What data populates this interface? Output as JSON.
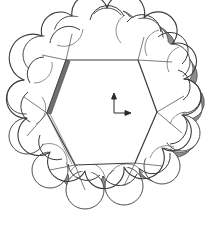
{
  "figure": {
    "title": "Hexagonal prism with twelve circular lobes",
    "type": "technical-line-drawing",
    "background_color": "#ffffff",
    "line_color": "#3a3a3a",
    "shade_color": "#6f6f6f",
    "dark_edge_color": "#4a4a4a",
    "fill_color": "#ffffff",
    "canvas": {
      "width": 214,
      "height": 226
    }
  },
  "geometry": {
    "hexagon": {
      "label": "central-hexagon-face",
      "vertices": [
        {
          "name": "top-left",
          "x": 66,
          "y": 60
        },
        {
          "name": "top-right",
          "x": 138,
          "y": 60
        },
        {
          "name": "right",
          "x": 157,
          "y": 112
        },
        {
          "name": "bottom-right",
          "x": 135,
          "y": 163
        },
        {
          "name": "bottom-left",
          "x": 75,
          "y": 165
        },
        {
          "name": "left",
          "x": 47,
          "y": 113
        }
      ]
    },
    "lobes": {
      "label": "perimeter-circular-lobes",
      "count": 12,
      "items": [
        {
          "index": 1,
          "cx": 107,
          "cy": 26,
          "r": 18,
          "shaded": true
        },
        {
          "index": 2,
          "cx": 144,
          "cy": 37,
          "r": 19,
          "shaded": true
        },
        {
          "index": 3,
          "cx": 172,
          "cy": 62,
          "r": 18,
          "shaded": true
        },
        {
          "index": 4,
          "cx": 184,
          "cy": 96,
          "r": 17,
          "shaded": true
        },
        {
          "index": 5,
          "cx": 182,
          "cy": 133,
          "r": 18,
          "shaded": true
        },
        {
          "index": 6,
          "cx": 162,
          "cy": 166,
          "r": 18,
          "shaded": true
        },
        {
          "index": 7,
          "cx": 124,
          "cy": 186,
          "r": 19,
          "shaded": true
        },
        {
          "index": 8,
          "cx": 85,
          "cy": 190,
          "r": 19,
          "shaded": true
        },
        {
          "index": 9,
          "cx": 50,
          "cy": 170,
          "r": 18,
          "shaded": false
        },
        {
          "index": 10,
          "cx": 27,
          "cy": 136,
          "r": 18,
          "shaded": false
        },
        {
          "index": 11,
          "cx": 24,
          "cy": 97,
          "r": 17,
          "shaded": false
        },
        {
          "index": 12,
          "cx": 42,
          "cy": 55,
          "r": 19,
          "shaded": false
        },
        {
          "index": 13,
          "cx": 72,
          "cy": 34,
          "r": 18,
          "shaded": false
        }
      ]
    },
    "highlight_edge": {
      "label": "upper-left-shaded-band",
      "from": {
        "x": 66,
        "y": 60
      },
      "to": {
        "x": 47,
        "y": 113
      },
      "thickness": 5,
      "color": "#6f6f6f"
    }
  },
  "axis_indicator": {
    "label": "coordinate-axis-marker",
    "origin": {
      "x": 114,
      "y": 113
    },
    "axes": [
      {
        "name": "vertical-axis",
        "direction": "up",
        "length": 18
      },
      {
        "name": "horizontal-axis",
        "direction": "right",
        "length": 14
      }
    ],
    "color": "#2a2a2a"
  }
}
